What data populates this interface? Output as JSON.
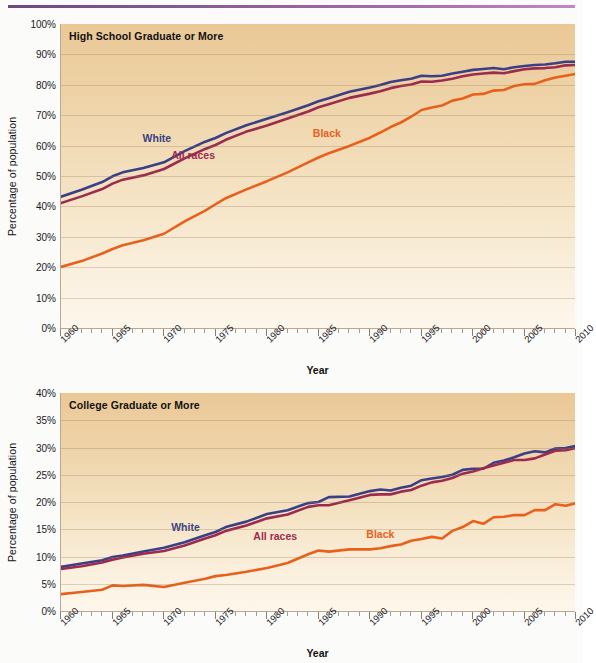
{
  "figure": {
    "y_axis_title": "Percentage of population",
    "x_axis_title": "Year"
  },
  "panels": [
    {
      "id": "hs",
      "title": "High School Graduate or More"
    },
    {
      "id": "col",
      "title": "College Graduate or More"
    }
  ],
  "series_labels": {
    "white": "White",
    "all_races": "All races",
    "black": "Black"
  },
  "colors": {
    "white": "#3b3f86",
    "all_races": "#9c2b4e",
    "black": "#e8601c",
    "panel_background_top": "#eac896",
    "panel_background_bottom": "#fdf7ec",
    "gridline": "#b09a7c",
    "top_rule": "#8e5f93"
  },
  "x_tick_labels_major": [
    "1960",
    "1965",
    "1970",
    "1975",
    "1980",
    "1985",
    "1990",
    "1995",
    "2000",
    "2005",
    "2010"
  ],
  "y_tick_labels_hs": [
    "100%",
    "90%",
    "80%",
    "70%",
    "60%",
    "50%",
    "40%",
    "30%",
    "20%",
    "10%",
    "0%"
  ],
  "y_tick_labels_col": [
    "40%",
    "35%",
    "30%",
    "25%",
    "20%",
    "15%",
    "10%",
    "5%",
    "0%"
  ],
  "chart_data": [
    {
      "type": "line",
      "title": "High School Graduate or More",
      "xlabel": "Year",
      "ylabel": "Percentage of population",
      "xlim": [
        1960,
        2010
      ],
      "ylim": [
        0,
        100
      ],
      "ytick_step": 10,
      "xtick_step": 5,
      "xtick_minor_step": 1,
      "grid": true,
      "legend": "inline-labels",
      "x": [
        1960,
        1962,
        1964,
        1965,
        1966,
        1968,
        1970,
        1972,
        1974,
        1975,
        1976,
        1978,
        1980,
        1982,
        1984,
        1985,
        1986,
        1988,
        1990,
        1991,
        1992,
        1993,
        1994,
        1995,
        1996,
        1997,
        1998,
        1999,
        2000,
        2001,
        2002,
        2003,
        2004,
        2005,
        2006,
        2007,
        2008,
        2009,
        2010
      ],
      "series": [
        {
          "name": "White",
          "color": "#3b3f86",
          "values": [
            43.2,
            45.5,
            48.0,
            49.9,
            51.2,
            52.6,
            54.5,
            58.2,
            61.3,
            62.5,
            64.1,
            66.7,
            68.8,
            71.0,
            73.3,
            74.6,
            75.6,
            77.7,
            79.1,
            79.9,
            80.9,
            81.5,
            82.0,
            83.0,
            82.8,
            83.0,
            83.7,
            84.3,
            84.9,
            85.2,
            85.5,
            85.1,
            85.8,
            86.2,
            86.5,
            86.7,
            87.1,
            87.6,
            87.6
          ]
        },
        {
          "name": "All races",
          "color": "#9c2b4e",
          "values": [
            41.1,
            43.3,
            45.7,
            47.5,
            48.8,
            50.2,
            52.3,
            55.8,
            58.9,
            60.2,
            61.9,
            64.6,
            66.6,
            68.9,
            71.2,
            72.6,
            73.6,
            75.7,
            77.1,
            77.9,
            78.9,
            79.6,
            80.1,
            81.1,
            81.0,
            81.4,
            82.0,
            82.8,
            83.4,
            83.7,
            84.0,
            83.8,
            84.5,
            85.1,
            85.4,
            85.5,
            85.8,
            86.4,
            86.5
          ]
        },
        {
          "name": "Black",
          "color": "#e8601c",
          "values": [
            20.1,
            22.0,
            24.5,
            26.0,
            27.2,
            28.9,
            31.0,
            35.1,
            38.6,
            40.7,
            42.7,
            45.6,
            48.3,
            51.2,
            54.5,
            56.1,
            57.5,
            59.9,
            62.6,
            64.3,
            66.1,
            67.6,
            69.5,
            71.7,
            72.5,
            73.2,
            74.8,
            75.5,
            76.8,
            77.0,
            78.1,
            78.3,
            79.6,
            80.2,
            80.3,
            81.5,
            82.4,
            83.0,
            83.6
          ]
        }
      ]
    },
    {
      "type": "line",
      "title": "College Graduate or More",
      "xlabel": "Year",
      "ylabel": "Percentage of population",
      "xlim": [
        1960,
        2010
      ],
      "ylim": [
        0,
        40
      ],
      "ytick_step": 5,
      "xtick_step": 5,
      "xtick_minor_step": 1,
      "grid": true,
      "legend": "inline-labels",
      "x": [
        1960,
        1962,
        1964,
        1965,
        1966,
        1968,
        1970,
        1972,
        1974,
        1975,
        1976,
        1978,
        1980,
        1982,
        1984,
        1985,
        1986,
        1988,
        1990,
        1991,
        1992,
        1993,
        1994,
        1995,
        1996,
        1997,
        1998,
        1999,
        2000,
        2001,
        2002,
        2003,
        2004,
        2005,
        2006,
        2007,
        2008,
        2009,
        2010
      ],
      "series": [
        {
          "name": "White",
          "color": "#3b3f86",
          "values": [
            8.1,
            8.7,
            9.3,
            9.9,
            10.2,
            10.9,
            11.6,
            12.6,
            13.9,
            14.5,
            15.4,
            16.4,
            17.8,
            18.5,
            19.8,
            20.0,
            20.9,
            21.0,
            22.0,
            22.3,
            22.1,
            22.6,
            23.0,
            24.0,
            24.3,
            24.6,
            25.0,
            25.9,
            26.1,
            26.1,
            27.2,
            27.6,
            28.2,
            28.9,
            29.3,
            29.1,
            29.8,
            29.9,
            30.3
          ]
        },
        {
          "name": "All races",
          "color": "#9c2b4e",
          "values": [
            7.7,
            8.2,
            8.9,
            9.4,
            9.8,
            10.5,
            11.0,
            12.0,
            13.3,
            13.9,
            14.7,
            15.7,
            17.0,
            17.7,
            19.1,
            19.4,
            19.4,
            20.3,
            21.3,
            21.4,
            21.4,
            21.9,
            22.2,
            23.0,
            23.6,
            23.9,
            24.4,
            25.2,
            25.6,
            26.2,
            26.7,
            27.2,
            27.7,
            27.7,
            28.0,
            28.7,
            29.4,
            29.5,
            29.9
          ]
        },
        {
          "name": "Black",
          "color": "#e8601c",
          "values": [
            3.1,
            3.5,
            3.9,
            4.7,
            4.6,
            4.8,
            4.4,
            5.2,
            5.9,
            6.4,
            6.6,
            7.2,
            7.9,
            8.8,
            10.4,
            11.1,
            10.9,
            11.3,
            11.3,
            11.5,
            11.9,
            12.2,
            12.9,
            13.2,
            13.6,
            13.3,
            14.7,
            15.4,
            16.5,
            16.0,
            17.2,
            17.3,
            17.6,
            17.6,
            18.5,
            18.5,
            19.6,
            19.3,
            19.8
          ]
        }
      ]
    }
  ]
}
